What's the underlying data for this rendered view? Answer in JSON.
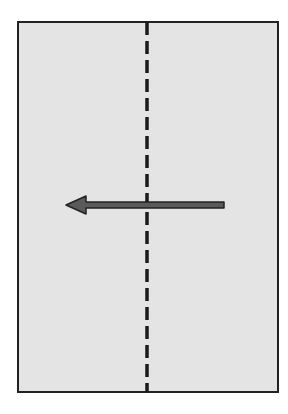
{
  "diagram": {
    "paper_color": "#e4e4e4",
    "border_color": "#222222",
    "fold_line": {
      "style": "dashed",
      "orientation": "vertical",
      "color": "#1a1a1a"
    },
    "arrow": {
      "direction": "left",
      "fill": "#5a5a5a",
      "outline": "#222222"
    }
  }
}
